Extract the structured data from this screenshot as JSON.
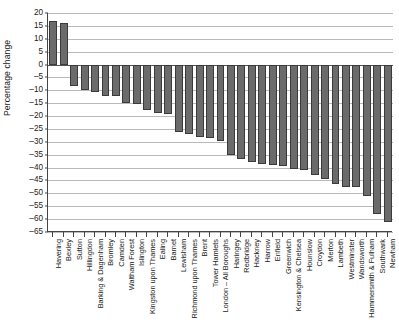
{
  "chart_data": {
    "type": "bar",
    "title": "",
    "xlabel": "",
    "ylabel": "Percentage change",
    "ylim": [
      -65,
      20
    ],
    "ytick_step": 5,
    "grid": true,
    "legend": "none",
    "bar_color": "#6b6b6b",
    "yticks": [
      "20",
      "15",
      "10",
      "5",
      "0",
      "-5",
      "-10",
      "-15",
      "-20",
      "-25",
      "-30",
      "-35",
      "-40",
      "-45",
      "-50",
      "-55",
      "-60",
      "-65"
    ],
    "categories": [
      "Havering",
      "Bexley",
      "Sutton",
      "Hillingdon",
      "Barking & Dagenham",
      "Bromley",
      "Camden",
      "Waltham Forest",
      "Islington",
      "Kingston upon Thames",
      "Ealing",
      "Barnet",
      "Lewisham",
      "Richmond upon Thames",
      "Brent",
      "Tower Hamlets",
      "London – All Boroughs",
      "Haringey",
      "Redbridge",
      "Hackney",
      "Harrow",
      "Enfield",
      "Greenwich",
      "Kensington & Chelsea",
      "Hounslow",
      "Croydon",
      "Merton",
      "Lambeth",
      "Westminster",
      "Wandsworth",
      "Hammersmith & Fulham",
      "Southwark",
      "Newham"
    ],
    "values": [
      17.0,
      16.3,
      -8.5,
      -10.0,
      -10.7,
      -12.3,
      -12.3,
      -15.0,
      -15.2,
      -17.5,
      -19.0,
      -19.2,
      -26.0,
      -27.0,
      -28.0,
      -28.5,
      -29.5,
      -35.0,
      -36.5,
      -38.0,
      -38.5,
      -39.0,
      -39.5,
      -40.5,
      -41.0,
      -43.0,
      -44.5,
      -46.5,
      -47.5,
      -47.5,
      -51.0,
      -58.0,
      -61.0
    ]
  }
}
